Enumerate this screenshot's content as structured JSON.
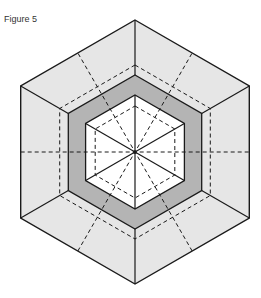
{
  "figure": {
    "label": "Figure 5"
  },
  "diagram": {
    "type": "hexagonal-fold-pattern",
    "center": [
      135,
      152
    ],
    "orientation": "pointy-top",
    "colors": {
      "outer_fill": "#e6e6e6",
      "band_fill": "#b4b4b4",
      "inner_fill": "#ffffff",
      "stroke": "#1a1a1a"
    },
    "rings": {
      "outer_radius": 132,
      "dashed_radius": 87,
      "band_outer_radius": 77,
      "band_inner_radius": 57,
      "inner_dashed_radius": 46
    },
    "lines": {
      "solid_spokes_in_inner": "center to 6 vertices of inner hexagon",
      "solid_corner_links": "outer vertices to band outer vertices",
      "dashed_through_center": "3 full lines toward edge midpoints (0°, 60°, 120°)",
      "dashed_inner_spokes": "center to edge midpoints inside inner hexagon"
    }
  }
}
